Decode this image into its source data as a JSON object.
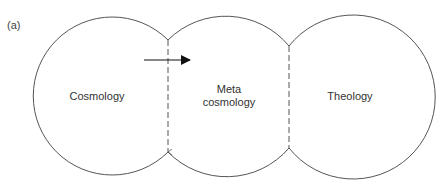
{
  "figure": {
    "panel_label": "(a)",
    "regions": [
      {
        "id": "cosmology",
        "label": "Cosmology"
      },
      {
        "id": "meta-cosmology",
        "label_line1": "Meta",
        "label_line2": "cosmology"
      },
      {
        "id": "theology",
        "label": "Theology"
      }
    ],
    "colors": {
      "stroke": "#555555",
      "arrow": "#111111",
      "text": "#333333",
      "background": "#ffffff"
    }
  }
}
